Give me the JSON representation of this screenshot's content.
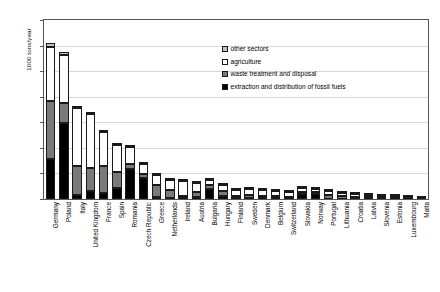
{
  "chart_data": {
    "type": "bar",
    "subtype": "stacked-vertical",
    "title": "",
    "xlabel": "",
    "ylabel": "1000 tons/year",
    "ylim": [
      0,
      7000
    ],
    "ytick_step": 1000,
    "yticks": [
      "7000",
      "6000",
      "5000",
      "4000",
      "3000",
      "2000",
      "1000",
      "0"
    ],
    "grid": true,
    "legend_position": "inside-top-right",
    "categories": [
      "Germany",
      "Poland",
      "Italy",
      "United Kingdom",
      "France",
      "Spain",
      "Romania",
      "Czech Republic",
      "Greece",
      "Netherlands",
      "Ireland",
      "Austria",
      "Bulgaria",
      "Hungary",
      "Finland",
      "Sweden",
      "Denmark",
      "Belgium",
      "Switzerland",
      "Slovakia",
      "Norway",
      "Portugal",
      "Lithuania",
      "Croatia",
      "Latvia",
      "Slovenia",
      "Estonia",
      "Luxembourg",
      "Malta"
    ],
    "series": [
      {
        "name": "extraction and distribution of fossil fuels",
        "color": "#000000",
        "values": [
          1560,
          2980,
          170,
          330,
          250,
          440,
          1160,
          820,
          70,
          55,
          30,
          95,
          410,
          130,
          40,
          35,
          25,
          30,
          10,
          215,
          190,
          20,
          15,
          12,
          8,
          25,
          40,
          5,
          2
        ]
      },
      {
        "name": "waste treatment and disposal",
        "color": "#7a7a7a",
        "values": [
          2260,
          760,
          1110,
          880,
          1040,
          610,
          200,
          145,
          490,
          300,
          80,
          170,
          130,
          190,
          95,
          110,
          95,
          105,
          85,
          60,
          70,
          120,
          90,
          80,
          60,
          45,
          25,
          35,
          22
        ]
      },
      {
        "name": "agriculture",
        "color": "#ffffff",
        "values": [
          2110,
          1900,
          2290,
          2130,
          1340,
          1070,
          690,
          410,
          370,
          400,
          600,
          365,
          190,
          230,
          215,
          250,
          250,
          195,
          175,
          145,
          115,
          165,
          145,
          110,
          105,
          60,
          40,
          30,
          10
        ]
      },
      {
        "name": "other sectors",
        "color": "#c4c4c4",
        "values": [
          165,
          100,
          60,
          50,
          40,
          35,
          30,
          25,
          30,
          25,
          20,
          20,
          15,
          15,
          15,
          15,
          12,
          12,
          10,
          10,
          10,
          10,
          8,
          8,
          7,
          6,
          5,
          4,
          2
        ]
      }
    ],
    "totals": [
      6095,
      5740,
      3630,
      3390,
      2670,
      2155,
      2080,
      1400,
      960,
      780,
      730,
      650,
      745,
      565,
      365,
      410,
      382,
      342,
      280,
      430,
      385,
      315,
      258,
      210,
      180,
      136,
      110,
      74,
      36
    ]
  },
  "legend": {
    "items": [
      {
        "label": "other sectors",
        "swatch": "light-gray"
      },
      {
        "label": "agriculture",
        "swatch": "white"
      },
      {
        "label": "waste treatment and disposal",
        "swatch": "dark-gray"
      },
      {
        "label": "extraction and distribution of fossil fuels",
        "swatch": "black"
      }
    ]
  }
}
